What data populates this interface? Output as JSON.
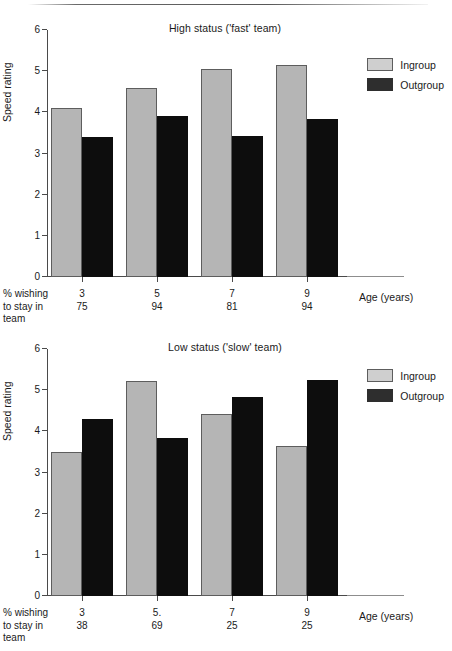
{
  "figure": {
    "ylabel": "Speed rating",
    "xlabel": "Age (years)",
    "pct_caption_line1": "% wishing",
    "pct_caption_line2": "to stay in",
    "pct_caption_line3": "team",
    "legend": {
      "ingroup": "Ingroup",
      "outgroup": "Outgroup"
    },
    "colors": {
      "ingroup": "#b5b5b5",
      "outgroup": "#0d0d0d",
      "axis": "#4a4a4a"
    },
    "yticks": [
      "0",
      "1",
      "2",
      "3",
      "4",
      "5",
      "6"
    ]
  },
  "chart_data": [
    {
      "type": "bar",
      "title": "High status ('fast' team)",
      "categories": [
        "3",
        "5",
        "7",
        "9"
      ],
      "xlabel": "Age (years)",
      "ylabel": "Speed rating",
      "ylim": [
        0,
        6
      ],
      "ytick_step": 1,
      "grid": false,
      "legend_position": "top-right",
      "series": [
        {
          "name": "Ingroup",
          "values": [
            4.1,
            4.6,
            5.05,
            5.15
          ]
        },
        {
          "name": "Outgroup",
          "values": [
            3.4,
            3.92,
            3.42,
            3.83
          ]
        }
      ],
      "annotation_row": {
        "label": "% wishing to stay in team",
        "values": [
          "75",
          "94",
          "81",
          "94"
        ]
      }
    },
    {
      "type": "bar",
      "title": "Low status ('slow' team)",
      "categories": [
        "3",
        "5.",
        "7",
        "9"
      ],
      "xlabel": "Age (years)",
      "ylabel": "Speed rating",
      "ylim": [
        0,
        6
      ],
      "ytick_step": 1,
      "grid": false,
      "legend_position": "top-right",
      "series": [
        {
          "name": "Ingroup",
          "values": [
            3.5,
            5.22,
            4.43,
            3.65
          ]
        },
        {
          "name": "Outgroup",
          "values": [
            4.3,
            3.83,
            4.83,
            5.25
          ]
        }
      ],
      "annotation_row": {
        "label": "% wishing to stay in team",
        "values": [
          "38",
          "69",
          "25",
          "25"
        ]
      }
    }
  ]
}
